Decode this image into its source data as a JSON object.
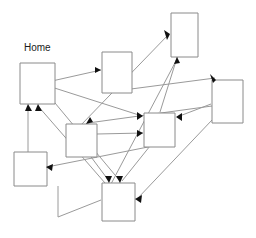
{
  "diagram": {
    "canvas": {
      "width": 256,
      "height": 238,
      "background": "#ffffff"
    },
    "style": {
      "node_stroke": "#8a8a8a",
      "node_fill": "#ffffff",
      "edge_stroke": "#9a9a9a",
      "arrow_fill": "#111111",
      "label_color": "#1a1a1a"
    },
    "labels": {
      "home": "Home"
    },
    "nodes": [
      {
        "id": "home",
        "label": "Home",
        "x": 20,
        "y": 63,
        "w": 35,
        "h": 41
      },
      {
        "id": "top",
        "label": "",
        "x": 171,
        "y": 13,
        "w": 27,
        "h": 44
      },
      {
        "id": "upper-mid",
        "label": "",
        "x": 102,
        "y": 52,
        "w": 30,
        "h": 41
      },
      {
        "id": "right",
        "label": "",
        "x": 212,
        "y": 80,
        "w": 31,
        "h": 43
      },
      {
        "id": "center",
        "label": "",
        "x": 144,
        "y": 113,
        "w": 31,
        "h": 34
      },
      {
        "id": "mid-left",
        "label": "",
        "x": 66,
        "y": 124,
        "w": 31,
        "h": 33
      },
      {
        "id": "bottom-left",
        "label": "",
        "x": 14,
        "y": 152,
        "w": 33,
        "h": 34
      },
      {
        "id": "bottom",
        "label": "",
        "x": 102,
        "y": 183,
        "w": 33,
        "h": 38
      }
    ],
    "edges": [
      {
        "from": "home",
        "to": "upper-mid",
        "x1": 43,
        "y1": 83,
        "x2": 101,
        "y2": 70,
        "arrow": "right"
      },
      {
        "from": "home",
        "to": "center",
        "x1": 42,
        "y1": 84,
        "x2": 143,
        "y2": 116,
        "arrow": "right"
      },
      {
        "from": "home",
        "to": "bottom",
        "x1": 40,
        "y1": 85,
        "x2": 120,
        "y2": 182,
        "arrow": "down"
      },
      {
        "from": "upper-mid",
        "to": "right",
        "x1": 108,
        "y1": 92,
        "x2": 215,
        "y2": 79,
        "arrow": "down-right"
      },
      {
        "from": "mid-left",
        "to": "top",
        "x1": 80,
        "y1": 126,
        "x2": 170,
        "y2": 34,
        "arrow": "up-right"
      },
      {
        "from": "bottom",
        "to": "top",
        "x1": 111,
        "y1": 184,
        "x2": 177,
        "y2": 58,
        "arrow": "up"
      },
      {
        "from": "top",
        "to": "center",
        "x1": 180,
        "y1": 46,
        "x2": 160,
        "y2": 112,
        "arrow": "down"
      },
      {
        "from": "right",
        "to": "center",
        "x1": 211,
        "y1": 104,
        "x2": 176,
        "y2": 117,
        "arrow": "left"
      },
      {
        "from": "right",
        "to": "mid-left",
        "x1": 212,
        "y1": 106,
        "x2": 87,
        "y2": 123,
        "arrow": "down-left"
      },
      {
        "from": "center",
        "to": "bottom",
        "x1": 150,
        "y1": 146,
        "x2": 122,
        "y2": 182,
        "arrow": "down"
      },
      {
        "from": "center",
        "to": "bottom-left",
        "x1": 148,
        "y1": 147,
        "x2": 46,
        "y2": 167,
        "arrow": "left"
      },
      {
        "from": "mid-left",
        "to": "bottom",
        "x1": 68,
        "y1": 126,
        "x2": 109,
        "y2": 182,
        "arrow": "down"
      },
      {
        "from": "bottom",
        "to": "home",
        "x1": 105,
        "y1": 183,
        "x2": 38,
        "y2": 105,
        "arrow": "up"
      },
      {
        "from": "bottom-left",
        "to": "home",
        "x1": 28,
        "y1": 153,
        "x2": 28,
        "y2": 105,
        "arrow": "up"
      },
      {
        "from": "bottom",
        "to": "bottom-left",
        "x1": 101,
        "y1": 200,
        "x2": 58,
        "y2": 217,
        "arrow": "none"
      },
      {
        "from": "right",
        "to": "bottom",
        "x1": 212,
        "y1": 120,
        "x2": 136,
        "y2": 199,
        "arrow": "left"
      },
      {
        "from": "mid-left",
        "to": "center",
        "x1": 97,
        "y1": 134,
        "x2": 143,
        "y2": 133,
        "arrow": "right"
      }
    ]
  }
}
